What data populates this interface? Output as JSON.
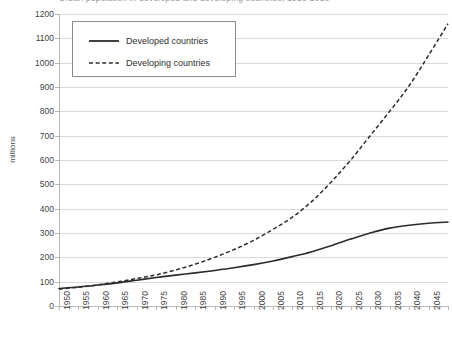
{
  "title": "Urban population in developed and developing countries, 1950-2050",
  "axes": {
    "y_title": "millions",
    "y_ticks": [
      "1200",
      "1100",
      "1000",
      "900",
      "800",
      "700",
      "600",
      "500",
      "400",
      "300",
      "200",
      "100",
      "0"
    ],
    "x_ticks": [
      "1950",
      "1955",
      "1960",
      "1965",
      "1970",
      "1975",
      "1980",
      "1985",
      "1990",
      "1995",
      "2000",
      "2005",
      "2010",
      "2015",
      "2020",
      "2025",
      "2030",
      "2035",
      "2040",
      "2045",
      "2050"
    ]
  },
  "legend": {
    "items": [
      {
        "label": "Developed countries",
        "style": "solid"
      },
      {
        "label": "Developing countries",
        "style": "dashed"
      }
    ]
  },
  "colors": {
    "line": "#2b2b2b",
    "gridline": "#d9d9d9",
    "axis": "#b9b9b9",
    "background": "#ffffff",
    "text": "#3f3f3f"
  },
  "chart_data": {
    "type": "line",
    "title": "Urban population in developed and developing countries, 1950-2050",
    "xlabel": "",
    "ylabel": "millions",
    "xlim": [
      1950,
      2050
    ],
    "ylim": [
      0,
      1200
    ],
    "ytick_step": 100,
    "xtick_step": 5,
    "grid": "horizontal",
    "legend_position": "top-left",
    "x": [
      1950,
      1955,
      1960,
      1965,
      1970,
      1975,
      1980,
      1985,
      1990,
      1995,
      2000,
      2005,
      2010,
      2015,
      2020,
      2025,
      2030,
      2035,
      2040,
      2045,
      2050
    ],
    "series": [
      {
        "name": "Developed countries",
        "style": "solid",
        "values": [
          72,
          78,
          86,
          95,
          106,
          117,
          127,
          136,
          146,
          157,
          170,
          185,
          203,
          223,
          248,
          275,
          300,
          320,
          332,
          340,
          345
        ]
      },
      {
        "name": "Developing countries",
        "style": "dashed",
        "values": [
          70,
          77,
          87,
          99,
          113,
          128,
          148,
          172,
          200,
          232,
          270,
          315,
          365,
          430,
          510,
          600,
          700,
          800,
          905,
          1030,
          1160
        ]
      }
    ]
  }
}
